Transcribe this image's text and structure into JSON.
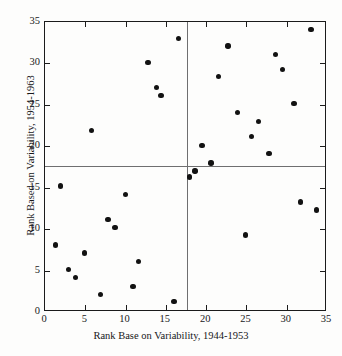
{
  "figure": {
    "top_caption_remnant": "",
    "x_axis_title": "Rank Base on Variability, 1944-1953",
    "y_axis_title": "Rank Based on Variability, 1954-1963"
  },
  "chart_data": {
    "type": "scatter",
    "title": "",
    "xlabel": "Rank Base on Variability, 1944-1953",
    "ylabel": "Rank Based on Variability, 1954-1963",
    "xlim": [
      0,
      35
    ],
    "ylim": [
      0,
      35
    ],
    "xticks": [
      0,
      5,
      10,
      15,
      20,
      25,
      30,
      35
    ],
    "yticks": [
      0,
      5,
      10,
      15,
      20,
      25,
      30,
      35
    ],
    "grid": false,
    "legend": null,
    "reference_lines": {
      "vertical_x": 17.6,
      "horizontal_y": 17.6
    },
    "marker": {
      "shape": "circle",
      "filled": true,
      "color": "#121212",
      "size_px": 5.4
    },
    "points": [
      {
        "x": 16.6,
        "y": 33.0
      },
      {
        "x": 12.8,
        "y": 30.1
      },
      {
        "x": 13.8,
        "y": 27.1
      },
      {
        "x": 14.4,
        "y": 26.1
      },
      {
        "x": 5.8,
        "y": 21.9
      },
      {
        "x": 22.7,
        "y": 32.1
      },
      {
        "x": 21.5,
        "y": 28.4
      },
      {
        "x": 28.6,
        "y": 31.1
      },
      {
        "x": 29.5,
        "y": 29.3
      },
      {
        "x": 33.0,
        "y": 34.1
      },
      {
        "x": 23.9,
        "y": 24.1
      },
      {
        "x": 26.5,
        "y": 23.0
      },
      {
        "x": 30.9,
        "y": 25.2
      },
      {
        "x": 25.6,
        "y": 21.2
      },
      {
        "x": 19.5,
        "y": 20.1
      },
      {
        "x": 27.8,
        "y": 19.1
      },
      {
        "x": 20.6,
        "y": 18.0
      },
      {
        "x": 18.6,
        "y": 17.0
      },
      {
        "x": 17.9,
        "y": 16.3
      },
      {
        "x": 1.9,
        "y": 15.2
      },
      {
        "x": 10.0,
        "y": 14.2
      },
      {
        "x": 7.8,
        "y": 11.2
      },
      {
        "x": 8.7,
        "y": 10.2
      },
      {
        "x": 1.3,
        "y": 8.1
      },
      {
        "x": 4.9,
        "y": 7.1
      },
      {
        "x": 11.6,
        "y": 6.1
      },
      {
        "x": 2.9,
        "y": 5.1
      },
      {
        "x": 3.8,
        "y": 4.2
      },
      {
        "x": 10.9,
        "y": 3.1
      },
      {
        "x": 6.9,
        "y": 2.1
      },
      {
        "x": 16.0,
        "y": 1.3
      },
      {
        "x": 24.9,
        "y": 9.3
      },
      {
        "x": 31.7,
        "y": 13.3
      },
      {
        "x": 33.7,
        "y": 12.3
      }
    ]
  }
}
